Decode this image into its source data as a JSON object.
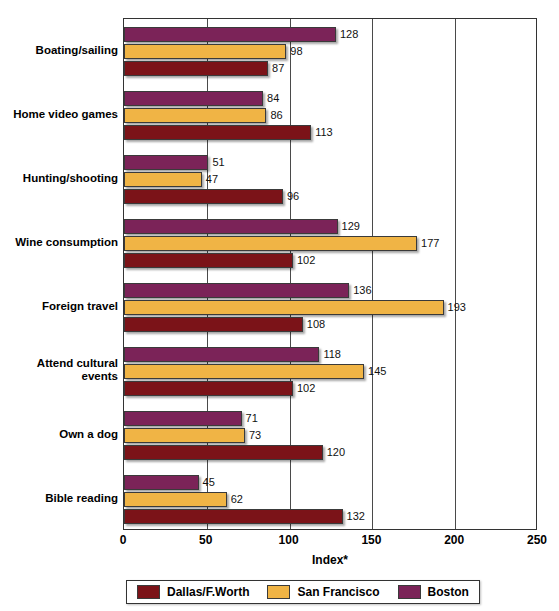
{
  "chart_data": {
    "type": "bar",
    "orientation": "horizontal",
    "title": "",
    "xlabel": "Index*",
    "ylabel": "",
    "xlim": [
      0,
      250
    ],
    "xticks": [
      0,
      50,
      100,
      150,
      200,
      250
    ],
    "grid": true,
    "legend_position": "bottom",
    "categories": [
      "Boating/sailing",
      "Home video games",
      "Hunting/shooting",
      "Wine consumption",
      "Foreign travel",
      "Attend cultural events",
      "Own a dog",
      "Bible reading"
    ],
    "series": [
      {
        "name": "Boston",
        "color": "#7B2358",
        "values": [
          128,
          84,
          51,
          129,
          136,
          118,
          71,
          45
        ]
      },
      {
        "name": "San Francisco",
        "color": "#F0B445",
        "values": [
          98,
          86,
          47,
          177,
          193,
          145,
          73,
          62
        ]
      },
      {
        "name": "Dallas/F.Worth",
        "color": "#7B1318",
        "values": [
          87,
          113,
          96,
          102,
          108,
          102,
          120,
          132
        ]
      }
    ]
  },
  "legend": {
    "items": [
      {
        "label": "Dallas/F.Worth",
        "key": "dallas"
      },
      {
        "label": "San Francisco",
        "key": "sanfrancisco"
      },
      {
        "label": "Boston",
        "key": "boston"
      }
    ]
  },
  "axis": {
    "x_title": "Index*",
    "tick_labels": [
      "0",
      "50",
      "100",
      "150",
      "200",
      "250"
    ]
  },
  "category_labels": {
    "0": "Boating/sailing",
    "1": "Home video games",
    "2": "Hunting/shooting",
    "3": "Wine consumption",
    "4": "Foreign travel",
    "5": "Attend cultural events",
    "6": "Own a dog",
    "7": "Bible reading"
  },
  "colors": {
    "boston": "#7B2358",
    "sanfrancisco": "#F0B445",
    "dallas": "#7B1318",
    "frame": "#333333",
    "background": "#FFFFFF"
  }
}
